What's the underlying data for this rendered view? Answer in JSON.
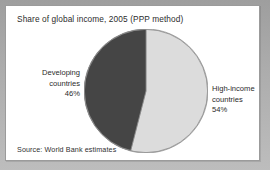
{
  "figure": {
    "title": "Share of global income, 2005 (PPP method)",
    "source": "Source: World Bank estimates"
  },
  "labels": {
    "developing": {
      "line1": "Developing",
      "line2": "countries",
      "percent": "46%"
    },
    "high_income": {
      "line1": "High-income",
      "line2": "countries",
      "percent": "54%"
    }
  },
  "colors": {
    "developing_slice": "#454545",
    "high_income_slice": "#dcdcdc",
    "slice_outline": "#8f8f8f",
    "card_background": "#ffffff",
    "card_border": "#9b9b9b",
    "page_background": "#a9a9a9",
    "text": "#2c2c2c"
  },
  "chart_data": {
    "type": "pie",
    "title": "Share of global income, 2005 (PPP method)",
    "xlabel": "",
    "ylabel": "",
    "legend_position": "callout-labels",
    "grid": false,
    "start_angle_deg": 0,
    "direction": "developing slice sweeps counter-clockwise from 12 o'clock",
    "categories": [
      "High-income countries",
      "Developing countries"
    ],
    "values": [
      54,
      46
    ],
    "unit": "percent",
    "slices": [
      {
        "label": "High-income countries",
        "value": 54,
        "display": "54%",
        "color": "#dcdcdc",
        "label_position": "right"
      },
      {
        "label": "Developing countries",
        "value": 46,
        "display": "46%",
        "color": "#454545",
        "label_position": "left"
      }
    ],
    "annotations": [
      "Source: World Bank estimates"
    ]
  }
}
